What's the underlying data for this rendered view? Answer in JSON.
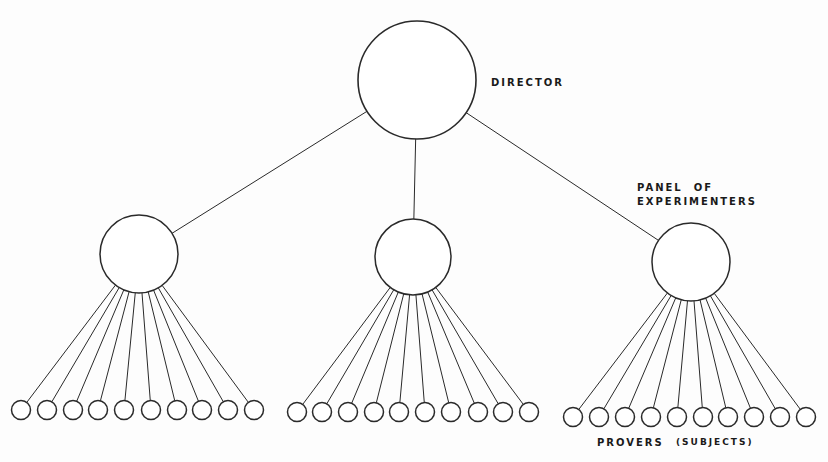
{
  "labels": {
    "director": "DIRECTOR",
    "panel_line1": "PANEL  OF",
    "panel_line2": "EXPERIMENTERS",
    "provers": "PROVERS",
    "subjects": "(SUBJECTS)"
  },
  "colors": {
    "stroke": "#2a2a2a",
    "background": "#fdfdfd"
  },
  "nodes": {
    "director": {
      "cx": 417,
      "cy": 80,
      "r": 59
    },
    "experimenters": [
      {
        "cx": 139,
        "cy": 254,
        "r": 39
      },
      {
        "cx": 413,
        "cy": 257,
        "r": 38
      },
      {
        "cx": 691,
        "cy": 262,
        "r": 39
      }
    ],
    "provers": [
      {
        "cy": 410,
        "r": 9.5,
        "xs": [
          21,
          47,
          73,
          98,
          124,
          151,
          177,
          202,
          228,
          254
        ]
      },
      {
        "cy": 412,
        "r": 9.5,
        "xs": [
          297,
          322,
          348,
          374,
          399,
          425,
          451,
          478,
          503,
          529
        ]
      },
      {
        "cy": 417,
        "r": 9.5,
        "xs": [
          573,
          599,
          625,
          651,
          677,
          703,
          728,
          754,
          780,
          806
        ]
      }
    ]
  }
}
